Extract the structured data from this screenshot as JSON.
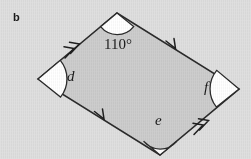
{
  "figure": {
    "part_label": "b",
    "shape_name": "parallelogram",
    "background_color": "#dfdfdf",
    "fill_color": "#cdcdcd",
    "stroke_color": "#2b2b2b",
    "arc_fill_color": "#ffffff",
    "vertices": {
      "left": {
        "x": 38,
        "y": 79
      },
      "top": {
        "x": 117,
        "y": 13
      },
      "right": {
        "x": 239,
        "y": 89
      },
      "bottom": {
        "x": 160,
        "y": 155
      }
    },
    "labels": {
      "top_angle": "110°",
      "left_angle": "d",
      "bottom_angle": "e",
      "right_angle": "f"
    },
    "tick_marks": {
      "upper_left_edge": "double-chevron-arrow",
      "lower_right_edge": "double-chevron-arrow",
      "upper_right_edge": "single-chevron-arrow",
      "lower_left_edge": "single-chevron-arrow"
    }
  }
}
